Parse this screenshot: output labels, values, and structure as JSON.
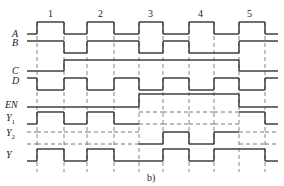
{
  "caption": "b)",
  "colors": {
    "line": "#333333",
    "guide": "#555555"
  },
  "time_edges": [
    27,
    37,
    64,
    87,
    114,
    139,
    163,
    189,
    214,
    239,
    265,
    278
  ],
  "guides": {
    "x": [
      37,
      64,
      87,
      114,
      139,
      163,
      189,
      214,
      239,
      265
    ],
    "y_top": 22,
    "y_bottom": 172
  },
  "pulse_labels": [
    {
      "text": "1",
      "x": 48,
      "y": 9
    },
    {
      "text": "2",
      "x": 98,
      "y": 9
    },
    {
      "text": "3",
      "x": 148,
      "y": 9
    },
    {
      "text": "4",
      "x": 198,
      "y": 9
    },
    {
      "text": "5",
      "x": 247,
      "y": 9
    }
  ],
  "signals": [
    {
      "name": "A",
      "sub": "",
      "label_x": 12,
      "label_y": 29,
      "hi": 22,
      "lo": 34,
      "levels": [
        "0",
        "1",
        "0",
        "1",
        "0",
        "1",
        "0",
        "1",
        "0",
        "1",
        "0"
      ]
    },
    {
      "name": "B",
      "sub": "",
      "label_x": 12,
      "label_y": 38,
      "hi": 41,
      "lo": 53,
      "levels": [
        "1",
        "1",
        "0",
        "1",
        "1",
        "0",
        "1",
        "0",
        "0",
        "1",
        "1"
      ]
    },
    {
      "name": "C",
      "sub": "",
      "label_x": 12,
      "label_y": 66,
      "hi": 60,
      "lo": 71,
      "levels": [
        "0",
        "0",
        "1",
        "1",
        "1",
        "1",
        "1",
        "1",
        "1",
        "0",
        "0"
      ]
    },
    {
      "name": "D",
      "sub": "",
      "label_x": 12,
      "label_y": 76,
      "hi": 78,
      "lo": 90,
      "levels": [
        "1",
        "0",
        "1",
        "0",
        "1",
        "0",
        "1",
        "0",
        "1",
        "0",
        "1"
      ]
    },
    {
      "name": "EN",
      "sub": "",
      "label_x": 5,
      "label_y": 100,
      "hi": 94,
      "lo": 107,
      "levels": [
        "0",
        "0",
        "0",
        "0",
        "0",
        "1",
        "1",
        "1",
        "1",
        "0",
        "0"
      ]
    },
    {
      "name": "Y",
      "sub": "1",
      "label_x": 6,
      "label_y": 113,
      "hi": 112,
      "lo": 124,
      "levels": [
        "0",
        "1",
        "0",
        "1",
        "0",
        "z",
        "z",
        "z",
        "z",
        "1",
        "0"
      ]
    },
    {
      "name": "Y",
      "sub": "2",
      "label_x": 6,
      "label_y": 128,
      "hi": 132,
      "lo": 144,
      "levels": [
        "z",
        "z",
        "z",
        "z",
        "z",
        "0",
        "1",
        "0",
        "1",
        "z",
        "z"
      ]
    },
    {
      "name": "Y",
      "sub": "",
      "label_x": 6,
      "label_y": 150,
      "hi": 149,
      "lo": 161,
      "levels": [
        "0",
        "1",
        "0",
        "1",
        "0",
        "0",
        "1",
        "0",
        "1",
        "1",
        "0"
      ]
    }
  ]
}
